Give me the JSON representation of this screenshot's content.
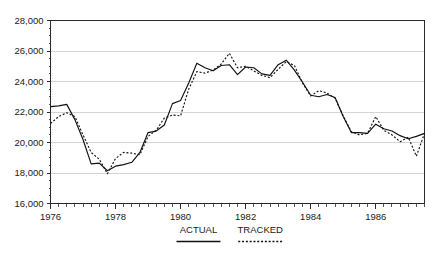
{
  "chart_data": {
    "type": "line",
    "title": "",
    "xlabel": "",
    "ylabel": "",
    "xlim": [
      1976.0,
      1987.5
    ],
    "ylim": [
      16000,
      28000
    ],
    "grid": true,
    "legend_position": "bottom",
    "y_ticks": [
      16000,
      18000,
      20000,
      22000,
      24000,
      26000,
      28000
    ],
    "y_tick_labels": [
      "16,000",
      "18,000",
      "20,000",
      "22,000",
      "24,000",
      "26,000",
      "28,000"
    ],
    "x_ticks": [
      1976,
      1978,
      1980,
      1982,
      1984,
      1986
    ],
    "x_tick_labels": [
      "1976",
      "1978",
      "1980",
      "1982",
      "1984",
      "1986"
    ],
    "x_minor_step": 0.25,
    "x": [
      1976.0,
      1976.25,
      1976.5,
      1976.75,
      1977.0,
      1977.25,
      1977.5,
      1977.75,
      1978.0,
      1978.25,
      1978.5,
      1978.75,
      1979.0,
      1979.25,
      1979.5,
      1979.75,
      1980.0,
      1980.25,
      1980.5,
      1980.75,
      1981.0,
      1981.25,
      1981.5,
      1981.75,
      1982.0,
      1982.25,
      1982.5,
      1982.75,
      1983.0,
      1983.25,
      1983.5,
      1983.75,
      1984.0,
      1984.25,
      1984.5,
      1984.75,
      1985.0,
      1985.25,
      1985.5,
      1985.75,
      1986.0,
      1986.25,
      1986.5,
      1986.75,
      1987.0,
      1987.25,
      1987.5
    ],
    "series": [
      {
        "name": "ACTUAL",
        "style": "solid",
        "values": [
          22350,
          22400,
          22500,
          21500,
          20200,
          18600,
          18650,
          18150,
          18450,
          18550,
          18700,
          19350,
          20650,
          20750,
          21150,
          22550,
          22750,
          23900,
          25200,
          24900,
          24700,
          25050,
          25100,
          24450,
          24950,
          24900,
          24500,
          24400,
          25100,
          25400,
          24750,
          23950,
          23100,
          23000,
          23150,
          22950,
          21700,
          20650,
          20650,
          20600,
          21200,
          20900,
          20750,
          20450,
          20250,
          20400,
          20600
        ]
      },
      {
        "name": "TRACKED",
        "style": "dotted",
        "values": [
          21250,
          21700,
          21950,
          21700,
          20500,
          19350,
          18900,
          17950,
          18950,
          19350,
          19300,
          19200,
          20400,
          20800,
          21600,
          21800,
          21750,
          23500,
          24650,
          24550,
          24750,
          25150,
          25850,
          24900,
          25000,
          24700,
          24400,
          24250,
          24800,
          25300,
          25050,
          23900,
          23050,
          23400,
          23250,
          22900,
          21750,
          20700,
          20500,
          20600,
          21700,
          20800,
          20500,
          20050,
          20350,
          19100,
          20600
        ]
      }
    ]
  },
  "legend": {
    "items": [
      {
        "label": "ACTUAL",
        "style": "solid"
      },
      {
        "label": "TRACKED",
        "style": "dotted"
      }
    ]
  }
}
